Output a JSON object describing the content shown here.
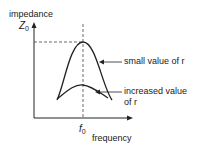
{
  "diagram": {
    "y_axis_label": "impedance",
    "y_marker": {
      "symbol": "Z",
      "subscript": "0"
    },
    "x_axis_label": "frequency",
    "x_marker": {
      "symbol": "f",
      "subscript": "0"
    },
    "curves": [
      {
        "name": "small-r",
        "label": "small value of r"
      },
      {
        "name": "increased-r",
        "label_line1": "increased value",
        "label_line2": "of r"
      }
    ],
    "colors": {
      "line": "#222222",
      "background": "#ffffff"
    }
  }
}
